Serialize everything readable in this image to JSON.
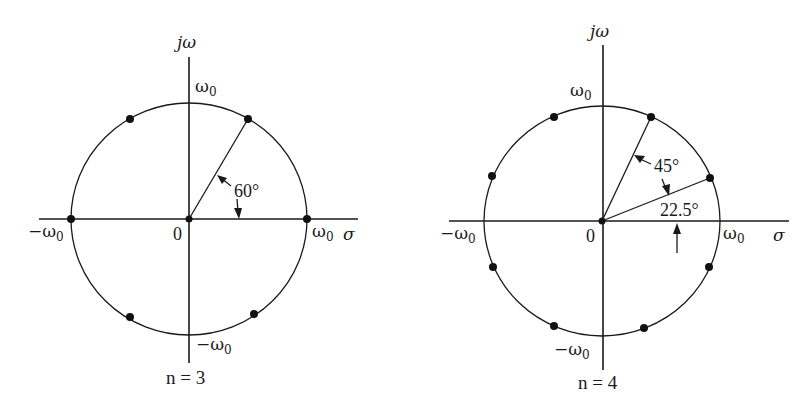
{
  "figure": {
    "type": "Butterworth pole locations on s-plane",
    "colors": {
      "ink": "#1a1a1a",
      "background": "#ffffff"
    }
  },
  "diagrams": [
    {
      "id": "n3",
      "caption": "n = 3",
      "axis_labels": {
        "vertical": "jω",
        "horizontal": "σ"
      },
      "tick_labels": {
        "top": "ω",
        "top_sub": "0",
        "bottom": "−ω",
        "bottom_sub": "0",
        "left": "−ω",
        "left_sub": "0",
        "right": "ω",
        "right_sub": "0",
        "origin": "0"
      },
      "angle_labels": [
        "60°"
      ],
      "pole_angles_deg": [
        0,
        60,
        120,
        180,
        240,
        300
      ],
      "radial_line_angle_deg": 60,
      "center": [
        189,
        219
      ],
      "radius": [
        117,
        116
      ]
    },
    {
      "id": "n4",
      "caption": "n = 4",
      "axis_labels": {
        "vertical": "jω",
        "horizontal": "σ"
      },
      "tick_labels": {
        "top": "ω",
        "top_sub": "0",
        "bottom": "−ω",
        "bottom_sub": "0",
        "left": "−ω",
        "left_sub": "0",
        "right": "ω",
        "right_sub": "0",
        "origin": "0"
      },
      "angle_labels": [
        "45°",
        "22.5°"
      ],
      "pole_angles_deg": [
        22.5,
        67.5,
        112.5,
        157.5,
        202.5,
        247.5,
        292.5,
        337.5
      ],
      "radial_line_angles_deg": [
        22.5,
        67.5
      ],
      "center": [
        602,
        221
      ],
      "radius": [
        118,
        115
      ]
    }
  ]
}
